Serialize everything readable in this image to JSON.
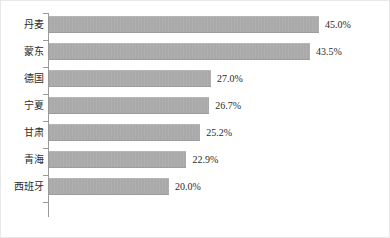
{
  "chart_data": {
    "type": "bar",
    "orientation": "horizontal",
    "title": "",
    "subtitle": "",
    "xlabel": "",
    "ylabel": "",
    "grid": false,
    "legend": null,
    "value_suffix": "%",
    "xlim": [
      0,
      50
    ],
    "categories": [
      "丹麦",
      "蒙东",
      "德国",
      "宁夏",
      "甘肃",
      "青海",
      "西班牙"
    ],
    "values": [
      45.0,
      43.5,
      27.0,
      26.7,
      25.2,
      22.9,
      20.0
    ],
    "data_labels": [
      "45.0%",
      "43.5%",
      "27.0%",
      "26.7%",
      "25.2%",
      "22.9%",
      "20.0%"
    ],
    "points": [
      {
        "category": "丹麦",
        "value": 45.0,
        "label": "45.0%"
      },
      {
        "category": "蒙东",
        "value": 43.5,
        "label": "43.5%"
      },
      {
        "category": "德国",
        "value": 27.0,
        "label": "27.0%"
      },
      {
        "category": "宁夏",
        "value": 26.7,
        "label": "26.7%"
      },
      {
        "category": "甘肃",
        "value": 25.2,
        "label": "25.2%"
      },
      {
        "category": "青海",
        "value": 22.9,
        "label": "22.9%"
      },
      {
        "category": "西班牙",
        "value": 20.0,
        "label": "20.0%"
      }
    ],
    "colors": {
      "bar_fill": "#a9a9a9",
      "axis_line": "#9a9a9a",
      "text": "#2b2b2b",
      "background": "#ffffff",
      "border": "#e8e8e8"
    }
  }
}
